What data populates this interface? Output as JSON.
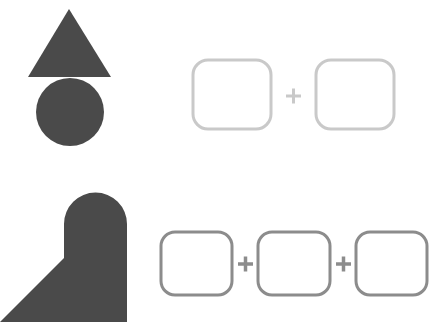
{
  "colors": {
    "shape_fill": "#4a4a4a",
    "top_box_stroke": "#c9c9c9",
    "bottom_box_stroke": "#8c8c8c",
    "background": "#ffffff"
  },
  "rows": [
    {
      "name": "top-row",
      "composite_shape": "triangle-on-circle",
      "answer_boxes": 2,
      "operators": [
        "+"
      ]
    },
    {
      "name": "bottom-row",
      "composite_shape": "triangle-plus-arched-rectangle",
      "answer_boxes": 3,
      "operators": [
        "+",
        "+"
      ]
    }
  ],
  "operators": {
    "plus": "+"
  }
}
